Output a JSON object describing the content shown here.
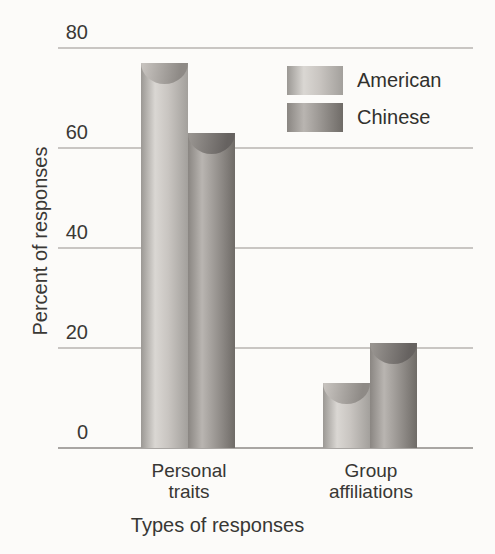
{
  "figure": {
    "background_color": "#fcfbf9",
    "text_color": "#3a3835",
    "gridline_color": "#c9c6c3",
    "baseline_color": "#a9a6a3"
  },
  "chart_data": {
    "type": "bar",
    "title": "",
    "xlabel": "Types of responses",
    "ylabel": "Percent of responses",
    "categories": [
      "Personal traits",
      "Group affiliations"
    ],
    "series": [
      {
        "name": "American",
        "values": [
          77,
          13
        ]
      },
      {
        "name": "Chinese",
        "values": [
          63,
          21
        ]
      }
    ],
    "yticks": [
      80,
      60,
      40,
      20,
      0
    ],
    "ylim": [
      0,
      80
    ],
    "grid": true,
    "legend_position": "upper right",
    "legend_entries": [
      "American",
      "Chinese"
    ]
  },
  "series_styles": [
    {
      "key": "american",
      "edge_left": "#9b9894",
      "highlight": "#dad7d3",
      "mid": "#c9c5c1",
      "edge_right": "#a3a09c",
      "cap_light": "#c6c2be",
      "cap_dark": "#8e8a86"
    },
    {
      "key": "chinese",
      "edge_left": "#8a8682",
      "highlight": "#b9b5b1",
      "mid": "#9c9894",
      "edge_right": "#6f6b67",
      "cap_light": "#989490",
      "cap_dark": "#666260"
    }
  ]
}
